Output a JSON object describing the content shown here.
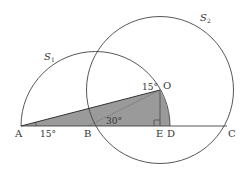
{
  "diagram": {
    "circles": [
      {
        "name": "S",
        "subscript": "1",
        "kind": "semicircle",
        "diameter": "AD"
      },
      {
        "name": "S",
        "subscript": "2",
        "kind": "circle",
        "center": "O",
        "through": [
          "B",
          "C"
        ]
      }
    ],
    "points": {
      "A": "A",
      "B": "B",
      "E": "E",
      "D": "D",
      "C": "C",
      "O": "O"
    },
    "angles": {
      "angle_A": "15°",
      "angle_B": "30°",
      "angle_O": "15°"
    },
    "shaded_region": "bounded by segment AO, arc OD of S1, and segment DA",
    "right_angle_at": "E",
    "colors": {
      "stroke": "#444444",
      "fill_shaded": "#9a9a9a"
    }
  }
}
